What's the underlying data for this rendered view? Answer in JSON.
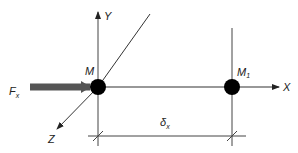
{
  "diagram": {
    "axes": {
      "x_label": "X",
      "y_label": "Y",
      "z_label": "Z"
    },
    "points": [
      {
        "name": "M",
        "label": "M",
        "sub": ""
      },
      {
        "name": "M1",
        "label": "M",
        "sub": "1"
      }
    ],
    "force": {
      "label": "F",
      "sub": "x"
    },
    "dimension": {
      "label": "δ",
      "sub": "x"
    },
    "colors": {
      "line": "#333333",
      "force_arrow": "#555555",
      "point": "#000000"
    }
  }
}
